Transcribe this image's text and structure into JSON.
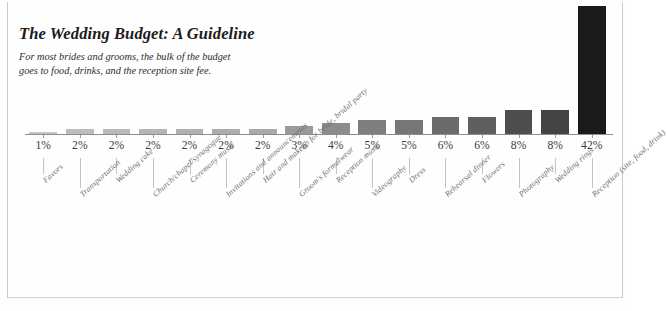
{
  "header": {
    "title": "The Wedding Budget: A Guideline",
    "subtitle_line1": "For most brides and grooms, the bulk of the budget",
    "subtitle_line2": "goes to food, drinks, and the reception site fee."
  },
  "chart_data": {
    "type": "bar",
    "title": "The Wedding Budget: A Guideline",
    "subtitle": "For most brides and grooms, the bulk of the budget goes to food, drinks, and the reception site fee.",
    "xlabel": "",
    "ylabel": "",
    "ylim": [
      0,
      42
    ],
    "grid": false,
    "legend": false,
    "value_suffix": "%",
    "categories": [
      "Favors",
      "Transportation",
      "Wedding cake",
      "Church/chapel/synagogue",
      "Ceremony music",
      "Invitations and announcements",
      "Hair and makeup for bride, bridal party",
      "Groom's formalwear",
      "Reception music",
      "Videography",
      "Dress",
      "Rehearsal dinner",
      "Flowers",
      "Photography",
      "Wedding rings",
      "Reception (site, food, drink)"
    ],
    "values": [
      1,
      2,
      2,
      2,
      2,
      2,
      2,
      3,
      4,
      5,
      5,
      6,
      6,
      8,
      8,
      42
    ],
    "value_labels": [
      "1%",
      "2%",
      "2%",
      "2%",
      "2%",
      "2%",
      "2%",
      "3%",
      "4%",
      "5%",
      "5%",
      "6%",
      "6%",
      "8%",
      "8%",
      "42%"
    ],
    "bar_colors": [
      "#c5c5c5",
      "#bdbdbd",
      "#b9b9b9",
      "#b5b5b5",
      "#b1b1b1",
      "#adadad",
      "#a9a9a9",
      "#9a9a9a",
      "#8c8c8c",
      "#7e7e7e",
      "#767676",
      "#6a6a6a",
      "#5f5f5f",
      "#4e4e4e",
      "#444444",
      "#1a1a1a"
    ]
  }
}
